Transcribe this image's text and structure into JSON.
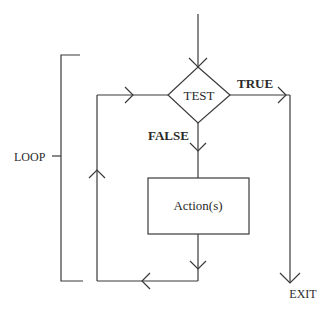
{
  "diagram": {
    "type": "flowchart",
    "title": "",
    "nodes": {
      "decision": {
        "label": "TEST",
        "shape": "diamond"
      },
      "process": {
        "label": "Action(s)",
        "shape": "rectangle"
      }
    },
    "edges": {
      "true_label": "TRUE",
      "false_label": "FALSE",
      "exit_label": "EXIT"
    },
    "bracket": {
      "label": "LOOP"
    },
    "colors": {
      "line": "#3a3a3a",
      "text": "#2a2a2a",
      "background": "#ffffff"
    }
  }
}
